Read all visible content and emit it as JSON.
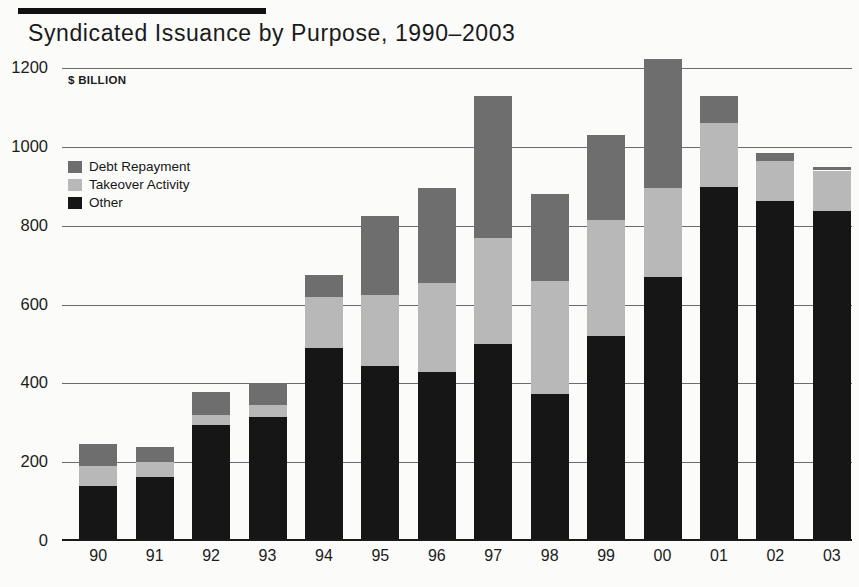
{
  "chart_data": {
    "type": "bar",
    "stacked": true,
    "title": "Syndicated Issuance by Purpose, 1990–2003",
    "units_label": "$ BILLION",
    "xlabel": "",
    "ylabel": "",
    "ylim": [
      0,
      1200
    ],
    "ytick_values": [
      1200,
      1000,
      800,
      600,
      400,
      200,
      0
    ],
    "ytick_labels": [
      "1200",
      "1000",
      "800",
      "600",
      "400",
      "200",
      "0"
    ],
    "grid": true,
    "grid_axis": "y",
    "legend_position": "upper-left-inside",
    "categories": [
      "90",
      "91",
      "92",
      "93",
      "94",
      "95",
      "96",
      "97",
      "98",
      "99",
      "00",
      "01",
      "02",
      "03"
    ],
    "series": [
      {
        "name": "Other",
        "color": "#161616",
        "values": [
          140,
          162,
          295,
          315,
          490,
          445,
          428,
          500,
          372,
          520,
          670,
          898,
          862,
          838
        ]
      },
      {
        "name": "Takeover Activity",
        "color": "#b8b8b8",
        "values": [
          50,
          38,
          25,
          30,
          130,
          180,
          227,
          270,
          288,
          295,
          225,
          162,
          103,
          102
        ]
      },
      {
        "name": "Debt Repayment",
        "color": "#6e6e6e",
        "values": [
          55,
          38,
          58,
          55,
          55,
          200,
          240,
          360,
          220,
          215,
          327,
          70,
          20,
          8
        ]
      }
    ],
    "totals": [
      245,
      238,
      378,
      400,
      675,
      825,
      895,
      1130,
      880,
      1030,
      1222,
      1130,
      985,
      948
    ]
  },
  "legend": {
    "items": [
      {
        "label": "Debt Repayment",
        "color": "#6e6e6e"
      },
      {
        "label": "Takeover Activity",
        "color": "#b8b8b8"
      },
      {
        "label": "Other",
        "color": "#161616"
      }
    ]
  }
}
